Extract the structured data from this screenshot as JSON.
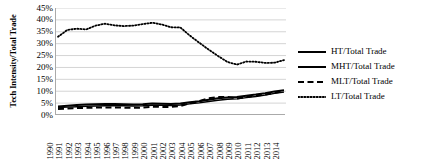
{
  "chart_data": {
    "type": "line",
    "title": "",
    "xlabel": "",
    "ylabel": "Tech Intensity/Total Trade",
    "ylim": [
      0,
      45
    ],
    "ytick_labels": [
      "45%",
      "40%",
      "35%",
      "30%",
      "25%",
      "20%",
      "15%",
      "10%",
      "5%",
      "0%"
    ],
    "ytick_values": [
      45,
      40,
      35,
      30,
      25,
      20,
      15,
      10,
      5,
      0
    ],
    "grid": true,
    "grid_axis": "y",
    "legend_position": "right",
    "x": [
      "1990",
      "1991",
      "1992",
      "1993",
      "1994",
      "1995",
      "1996",
      "1997",
      "1998",
      "1999",
      "2000",
      "2001",
      "2002",
      "2003",
      "2004",
      "2005",
      "2006",
      "2007",
      "2008",
      "2009",
      "2010",
      "2011",
      "2012",
      "2013",
      "2014"
    ],
    "categories": [
      "1990",
      "1991",
      "1992",
      "1993",
      "1994",
      "1995",
      "1996",
      "1997",
      "1998",
      "1999",
      "2000",
      "2001",
      "2002",
      "2003",
      "2004",
      "2005",
      "2006",
      "2007",
      "2008",
      "2009",
      "2010",
      "2011",
      "2012",
      "2013",
      "2014"
    ],
    "series": [
      {
        "name": "HT/Total Trade",
        "key": "ht",
        "style": "solid",
        "color": "#000000",
        "width": 2,
        "values": [
          3.6,
          3.9,
          4.2,
          4.4,
          4.5,
          4.6,
          4.6,
          4.5,
          4.4,
          4.5,
          4.8,
          4.7,
          4.6,
          4.8,
          5.4,
          5.8,
          6.4,
          7.0,
          7.4,
          7.6,
          8.1,
          8.6,
          9.2,
          9.9,
          10.4
        ]
      },
      {
        "name": "MHT/Total Trade",
        "key": "mht",
        "style": "solid",
        "color": "#000000",
        "width": 1.4,
        "values": [
          3.1,
          3.3,
          3.5,
          3.7,
          3.8,
          3.9,
          3.9,
          3.9,
          3.8,
          3.9,
          4.1,
          4.1,
          4.0,
          4.2,
          4.7,
          5.1,
          5.7,
          6.2,
          6.6,
          6.8,
          7.3,
          7.8,
          8.4,
          9.1,
          9.6
        ]
      },
      {
        "name": "MLT/Total Trade",
        "key": "mlt",
        "style": "dashed",
        "color": "#000000",
        "width": 2,
        "values": [
          2.5,
          2.7,
          2.9,
          3.0,
          3.1,
          3.2,
          3.2,
          3.1,
          3.0,
          3.1,
          3.5,
          3.4,
          3.4,
          3.8,
          4.9,
          5.9,
          7.0,
          7.6,
          7.6,
          6.9,
          7.6,
          8.2,
          8.6,
          9.3,
          10.1
        ]
      },
      {
        "name": "LT/Total Trade",
        "key": "lt",
        "style": "dotted",
        "color": "#000000",
        "width": 1.8,
        "values": [
          32.9,
          35.8,
          36.3,
          36.0,
          37.6,
          38.4,
          37.7,
          37.4,
          37.6,
          38.2,
          38.8,
          38.1,
          36.9,
          36.8,
          33.4,
          30.4,
          27.5,
          24.8,
          22.3,
          21.2,
          22.5,
          22.4,
          21.9,
          22.0,
          23.1
        ]
      }
    ],
    "legend_entries": [
      {
        "label": "HT/Total Trade",
        "style": "solid",
        "key": "ht"
      },
      {
        "label": "MHT/Total Trade",
        "style": "solid",
        "key": "mht"
      },
      {
        "label": "MLT/Total Trade",
        "style": "dashed",
        "key": "mlt"
      },
      {
        "label": "LT/Total Trade",
        "style": "dotted",
        "key": "lt"
      }
    ]
  }
}
